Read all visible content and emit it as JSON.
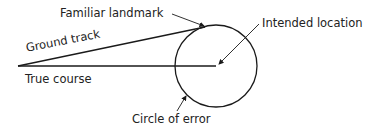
{
  "labels": {
    "familiar_landmark": "Familiar landmark",
    "intended_location": "Intended location",
    "ground_track": "Ground track",
    "true_course": "True course",
    "circle_of_error": "Circle of error"
  },
  "colors": {
    "stroke": "#1a1a1a",
    "text": "#222222",
    "background": "#ffffff"
  }
}
